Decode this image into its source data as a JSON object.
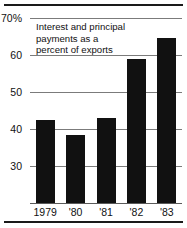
{
  "chart_data": {
    "type": "bar",
    "title": "",
    "annotation": {
      "lines": [
        "Interest and principal",
        "payments as a",
        "percent of exports"
      ]
    },
    "categories": [
      "1979",
      "'80",
      "'81",
      "'82",
      "'83"
    ],
    "values": [
      42.5,
      38.5,
      43,
      59,
      64.5
    ],
    "xlabel": "",
    "ylabel": "",
    "ylim": [
      20,
      70
    ],
    "yticks": [
      70,
      60,
      50,
      40,
      30
    ],
    "ytick_labels": [
      "70%",
      "60",
      "50",
      "40",
      "30"
    ],
    "grid": true,
    "legend": "none",
    "bar_color": "#111111"
  },
  "figure": {
    "rule_color": "#1a1a1a",
    "grid_color": "#7b7b7b"
  }
}
